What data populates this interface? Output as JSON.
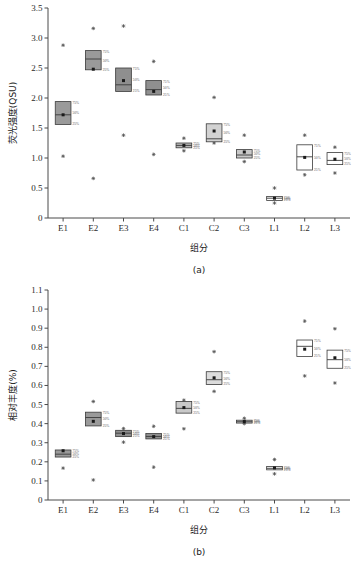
{
  "figure": {
    "panel_a_caption": "(a)",
    "panel_b_caption": "(b)",
    "xlabel": "组分",
    "ylabel_a": "荧光强度(QSU)",
    "ylabel_b": "相对丰度(%)",
    "percentile_labels": {
      "upper": "75%",
      "middle": "50%",
      "lower": "25%"
    }
  },
  "chart_data": [
    {
      "type": "box",
      "panel": "(a)",
      "title": "",
      "xlabel": "组分",
      "ylabel": "荧光强度(QSU)",
      "ylim": [
        0,
        3.5
      ],
      "yticks": [
        "0",
        "0.5",
        "1.0",
        "1.5",
        "2.0",
        "2.5",
        "3.0",
        "3.5"
      ],
      "ytick_values": [
        0,
        0.5,
        1.0,
        1.5,
        2.0,
        2.5,
        3.0,
        3.5
      ],
      "grid": false,
      "legend": "none",
      "annotations": [
        "75%",
        "50%",
        "25%"
      ],
      "categories": [
        "E1",
        "E2",
        "E3",
        "E4",
        "C1",
        "C2",
        "C3",
        "L1",
        "L2",
        "L3"
      ],
      "boxes": [
        {
          "category": "E1",
          "q25": 1.56,
          "median": 1.72,
          "q75": 1.94,
          "mean": 1.72,
          "fill": "#9a9a9a",
          "outliers": [
            2.88,
            1.03
          ]
        },
        {
          "category": "E2",
          "q25": 2.47,
          "median": 2.65,
          "q75": 2.79,
          "mean": 2.48,
          "fill": "#9a9a9a",
          "outliers": [
            3.16,
            0.66
          ]
        },
        {
          "category": "E3",
          "q25": 2.11,
          "median": 2.22,
          "q75": 2.5,
          "mean": 2.29,
          "fill": "#8f8f8f",
          "outliers": [
            3.2,
            1.38
          ]
        },
        {
          "category": "E4",
          "q25": 2.05,
          "median": 2.14,
          "q75": 2.29,
          "mean": 2.11,
          "fill": "#8f8f8f",
          "outliers": [
            2.61,
            1.06
          ]
        },
        {
          "category": "C1",
          "q25": 1.17,
          "median": 1.21,
          "q75": 1.25,
          "mean": 1.21,
          "fill": "#b5b5b5",
          "outliers": [
            1.33,
            1.12
          ]
        },
        {
          "category": "C2",
          "q25": 1.27,
          "median": 1.32,
          "q75": 1.57,
          "mean": 1.45,
          "fill": "#d2d2d2",
          "outliers": [
            2.01,
            1.25
          ]
        },
        {
          "category": "C3",
          "q25": 1.0,
          "median": 1.05,
          "q75": 1.14,
          "mean": 1.1,
          "fill": "#c9c9c9",
          "outliers": [
            1.38,
            0.94
          ]
        },
        {
          "category": "L1",
          "q25": 0.29,
          "median": 0.33,
          "q75": 0.36,
          "mean": 0.33,
          "fill": "#ffffff",
          "outliers": [
            0.5,
            0.25
          ]
        },
        {
          "category": "L2",
          "q25": 0.8,
          "median": 1.02,
          "q75": 1.22,
          "mean": 1.01,
          "fill": "#ffffff",
          "outliers": [
            1.38,
            0.72
          ]
        },
        {
          "category": "L3",
          "q25": 0.89,
          "median": 0.96,
          "q75": 1.09,
          "mean": 0.98,
          "fill": "#ffffff",
          "outliers": [
            1.18,
            0.75
          ]
        }
      ]
    },
    {
      "type": "box",
      "panel": "(b)",
      "title": "",
      "xlabel": "组分",
      "ylabel": "相对丰度(%)",
      "ylim": [
        0,
        1.1
      ],
      "yticks": [
        "0",
        "0.1",
        "0.2",
        "0.3",
        "0.4",
        "0.5",
        "0.6",
        "0.7",
        "0.8",
        "0.9",
        "1.0",
        "1.1"
      ],
      "ytick_values": [
        0,
        0.1,
        0.2,
        0.3,
        0.4,
        0.5,
        0.6,
        0.7,
        0.8,
        0.9,
        1.0,
        1.1
      ],
      "grid": false,
      "legend": "none",
      "annotations": [
        "75%",
        "50%",
        "25%"
      ],
      "categories": [
        "E1",
        "E2",
        "E3",
        "E4",
        "C1",
        "C2",
        "C3",
        "L1",
        "L2",
        "L3"
      ],
      "boxes": [
        {
          "category": "E1",
          "q25": 0.225,
          "median": 0.24,
          "q75": 0.262,
          "mean": 0.258,
          "fill": "#9a9a9a",
          "outliers": [
            0.167
          ]
        },
        {
          "category": "E2",
          "q25": 0.388,
          "median": 0.432,
          "q75": 0.46,
          "mean": 0.412,
          "fill": "#9a9a9a",
          "outliers": [
            0.516,
            0.105
          ]
        },
        {
          "category": "E3",
          "q25": 0.332,
          "median": 0.35,
          "q75": 0.365,
          "mean": 0.348,
          "fill": "#8f8f8f",
          "outliers": [
            0.374,
            0.303
          ]
        },
        {
          "category": "E4",
          "q25": 0.32,
          "median": 0.333,
          "q75": 0.348,
          "mean": 0.332,
          "fill": "#8f8f8f",
          "outliers": [
            0.386,
            0.172
          ]
        },
        {
          "category": "C1",
          "q25": 0.455,
          "median": 0.48,
          "q75": 0.516,
          "mean": 0.484,
          "fill": "#c9c9c9",
          "outliers": [
            0.523,
            0.373
          ]
        },
        {
          "category": "C2",
          "q25": 0.605,
          "median": 0.63,
          "q75": 0.672,
          "mean": 0.64,
          "fill": "#dcdcdc",
          "outliers": [
            0.777,
            0.569
          ]
        },
        {
          "category": "C3",
          "q25": 0.403,
          "median": 0.41,
          "q75": 0.418,
          "mean": 0.411,
          "fill": "#c9c9c9",
          "outliers": [
            0.428,
            0.4
          ]
        },
        {
          "category": "L1",
          "q25": 0.158,
          "median": 0.166,
          "q75": 0.175,
          "mean": 0.168,
          "fill": "#ffffff",
          "outliers": [
            0.212,
            0.137
          ]
        },
        {
          "category": "L2",
          "q25": 0.752,
          "median": 0.805,
          "q75": 0.838,
          "mean": 0.79,
          "fill": "#ffffff",
          "outliers": [
            0.937,
            0.65
          ]
        },
        {
          "category": "L3",
          "q25": 0.69,
          "median": 0.735,
          "q75": 0.785,
          "mean": 0.745,
          "fill": "#ffffff",
          "outliers": [
            0.897,
            0.613
          ]
        }
      ]
    }
  ]
}
